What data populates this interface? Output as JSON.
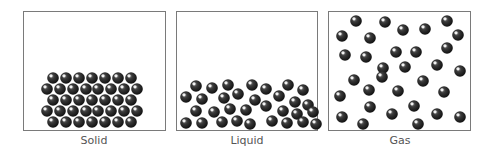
{
  "colors": {
    "particle": "#1e1e1e",
    "highlight": "#ffffff",
    "border": "#7a7a7a",
    "label": "#555555"
  },
  "panels": [
    {
      "id": "solid",
      "label": "Solid",
      "x": 23,
      "width": 143,
      "label_center": 94
    },
    {
      "id": "liquid",
      "label": "Liquid",
      "x": 176,
      "width": 142,
      "label_center": 247
    },
    {
      "id": "gas",
      "label": "Gas",
      "x": 328,
      "width": 143,
      "label_center": 400
    }
  ],
  "particles": {
    "radius": 5.8,
    "solid": [
      [
        53,
        78
      ],
      [
        66,
        78
      ],
      [
        79,
        78
      ],
      [
        92,
        78
      ],
      [
        105,
        78
      ],
      [
        118,
        78
      ],
      [
        131,
        78
      ],
      [
        47,
        89
      ],
      [
        60,
        89
      ],
      [
        73,
        89
      ],
      [
        86,
        89
      ],
      [
        98,
        89
      ],
      [
        111,
        89
      ],
      [
        124,
        89
      ],
      [
        137,
        89
      ],
      [
        53,
        100
      ],
      [
        66,
        100
      ],
      [
        79,
        100
      ],
      [
        92,
        100
      ],
      [
        105,
        100
      ],
      [
        118,
        100
      ],
      [
        131,
        100
      ],
      [
        47,
        111
      ],
      [
        60,
        111
      ],
      [
        73,
        111
      ],
      [
        86,
        111
      ],
      [
        98,
        111
      ],
      [
        111,
        111
      ],
      [
        124,
        111
      ],
      [
        137,
        111
      ],
      [
        53,
        122
      ],
      [
        66,
        122
      ],
      [
        79,
        122
      ],
      [
        92,
        122
      ],
      [
        105,
        122
      ],
      [
        118,
        122
      ],
      [
        131,
        122
      ]
    ],
    "liquid": [
      [
        196,
        86
      ],
      [
        212,
        88
      ],
      [
        228,
        85
      ],
      [
        252,
        85
      ],
      [
        266,
        89
      ],
      [
        288,
        85
      ],
      [
        303,
        90
      ],
      [
        186,
        97
      ],
      [
        202,
        99
      ],
      [
        224,
        98
      ],
      [
        238,
        94
      ],
      [
        255,
        100
      ],
      [
        279,
        96
      ],
      [
        295,
        102
      ],
      [
        308,
        105
      ],
      [
        196,
        111
      ],
      [
        214,
        112
      ],
      [
        230,
        109
      ],
      [
        246,
        110
      ],
      [
        266,
        106
      ],
      [
        283,
        111
      ],
      [
        297,
        114
      ],
      [
        313,
        112
      ],
      [
        186,
        123
      ],
      [
        202,
        123
      ],
      [
        222,
        122
      ],
      [
        237,
        121
      ],
      [
        250,
        124
      ],
      [
        272,
        121
      ],
      [
        287,
        123
      ],
      [
        303,
        122
      ],
      [
        316,
        124
      ]
    ],
    "gas": [
      [
        356,
        21
      ],
      [
        385,
        22
      ],
      [
        403,
        30
      ],
      [
        425,
        29
      ],
      [
        447,
        21
      ],
      [
        342,
        36
      ],
      [
        370,
        38
      ],
      [
        458,
        35
      ],
      [
        345,
        55
      ],
      [
        366,
        57
      ],
      [
        396,
        52
      ],
      [
        416,
        52
      ],
      [
        447,
        48
      ],
      [
        383,
        68
      ],
      [
        405,
        67
      ],
      [
        437,
        65
      ],
      [
        460,
        71
      ],
      [
        354,
        80
      ],
      [
        382,
        77
      ],
      [
        423,
        81
      ],
      [
        340,
        96
      ],
      [
        369,
        90
      ],
      [
        398,
        91
      ],
      [
        444,
        92
      ],
      [
        370,
        107
      ],
      [
        414,
        106
      ],
      [
        342,
        117
      ],
      [
        392,
        114
      ],
      [
        437,
        114
      ],
      [
        460,
        117
      ],
      [
        363,
        124
      ],
      [
        418,
        124
      ]
    ]
  }
}
